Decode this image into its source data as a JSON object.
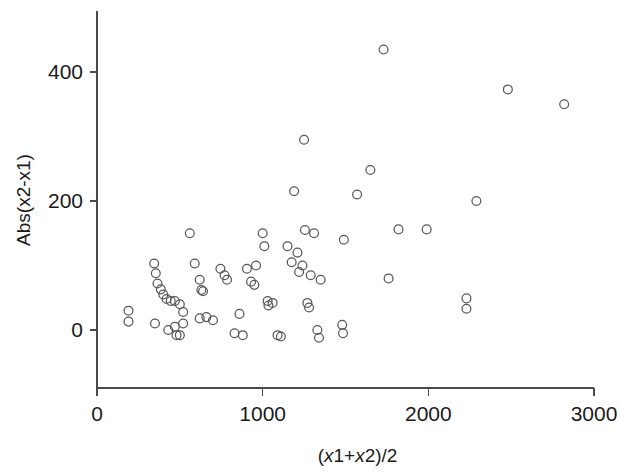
{
  "chart_data": {
    "type": "scatter",
    "title": "",
    "xlabel": "(x1+x2)/2",
    "ylabel": "Abs(x2-x1)",
    "xlim": [
      0,
      3000
    ],
    "ylim": [
      -80,
      480
    ],
    "xticks": [
      0,
      1000,
      2000,
      3000
    ],
    "xtick_labels": [
      "0",
      "1000",
      "2000",
      "3000"
    ],
    "yticks": [
      0,
      200,
      400
    ],
    "ytick_labels": [
      "0",
      "200",
      "400"
    ],
    "grid": false,
    "legend": null,
    "marker": "open-circle",
    "marker_color": "#58585c",
    "points": [
      [
        190,
        30
      ],
      [
        190,
        13
      ],
      [
        345,
        103
      ],
      [
        355,
        88
      ],
      [
        365,
        72
      ],
      [
        385,
        63
      ],
      [
        400,
        55
      ],
      [
        420,
        48
      ],
      [
        445,
        45
      ],
      [
        470,
        45
      ],
      [
        500,
        40
      ],
      [
        520,
        28
      ],
      [
        350,
        10
      ],
      [
        430,
        0
      ],
      [
        470,
        5
      ],
      [
        480,
        -8
      ],
      [
        500,
        -8
      ],
      [
        520,
        10
      ],
      [
        560,
        150
      ],
      [
        590,
        103
      ],
      [
        620,
        78
      ],
      [
        630,
        62
      ],
      [
        640,
        60
      ],
      [
        620,
        18
      ],
      [
        660,
        20
      ],
      [
        700,
        15
      ],
      [
        745,
        95
      ],
      [
        770,
        85
      ],
      [
        785,
        78
      ],
      [
        830,
        -5
      ],
      [
        860,
        25
      ],
      [
        880,
        -8
      ],
      [
        905,
        95
      ],
      [
        930,
        75
      ],
      [
        950,
        70
      ],
      [
        960,
        100
      ],
      [
        1000,
        150
      ],
      [
        1010,
        130
      ],
      [
        1030,
        45
      ],
      [
        1035,
        38
      ],
      [
        1060,
        42
      ],
      [
        1090,
        -8
      ],
      [
        1110,
        -10
      ],
      [
        1150,
        130
      ],
      [
        1175,
        105
      ],
      [
        1190,
        215
      ],
      [
        1210,
        120
      ],
      [
        1220,
        90
      ],
      [
        1240,
        100
      ],
      [
        1250,
        295
      ],
      [
        1255,
        155
      ],
      [
        1270,
        42
      ],
      [
        1280,
        35
      ],
      [
        1290,
        85
      ],
      [
        1310,
        150
      ],
      [
        1330,
        0
      ],
      [
        1340,
        -12
      ],
      [
        1350,
        78
      ],
      [
        1480,
        8
      ],
      [
        1485,
        -5
      ],
      [
        1490,
        140
      ],
      [
        1570,
        210
      ],
      [
        1650,
        248
      ],
      [
        1730,
        435
      ],
      [
        1760,
        80
      ],
      [
        1820,
        156
      ],
      [
        1990,
        156
      ],
      [
        2230,
        49
      ],
      [
        2230,
        33
      ],
      [
        2290,
        200
      ],
      [
        2480,
        373
      ],
      [
        2820,
        350
      ]
    ]
  },
  "axes": {
    "x_title": "(x1+x2)/2",
    "y_title": "Abs(x2-x1)"
  }
}
